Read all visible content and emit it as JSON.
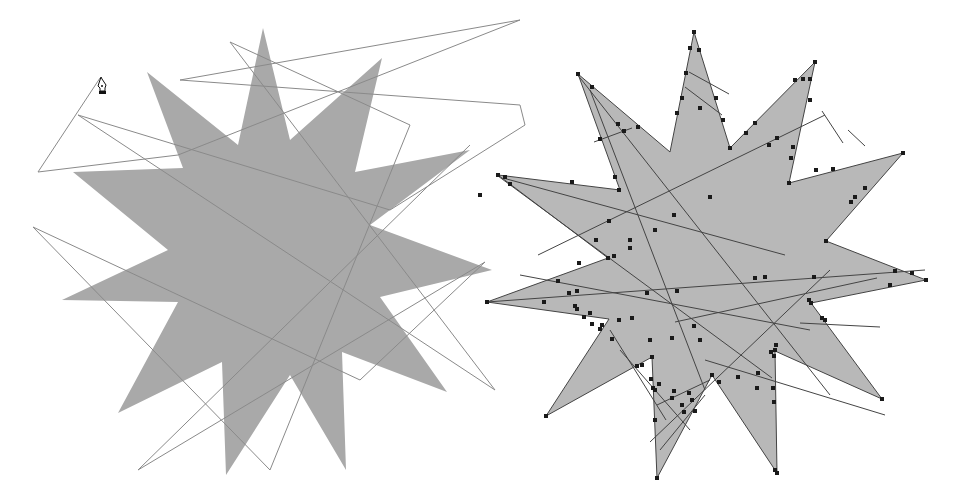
{
  "figure": {
    "colors": {
      "background": "#ffffff",
      "star_fill": "#a9a9a9",
      "right_star_fill": "#b8b8b8",
      "stroke": "#555555",
      "path_stroke": "#8a8a8a",
      "anchor": "#1a1a1a"
    }
  },
  "left_panel": {
    "star_points": "263,28 290,140 382,58 355,172 470,150 370,225 492,270 380,297 447,392 342,352 346,470 290,375 226,475 222,362 118,413 178,302 62,300 168,250 73,172 183,168 147,72 238,145",
    "path_points": "100,78 38,172 178,155 520,20 180,80 520,105 525,125 390,210 78,115 495,390 230,42 410,125 270,470 33,227 360,380 485,262 138,470 470,145",
    "cursor": "pen-tool-cursor"
  },
  "right_panel": {
    "star_points": "694,32 730,148 815,62 789,183 903,153 826,241 926,280 811,303 882,399 775,351 777,473 712,375 657,478 652,357 546,416 609,319 487,302 608,258 498,175 620,190 578,74 670,152",
    "lines": [
      "577,74 830,395",
      "590,90 705,390",
      "503,178 785,255",
      "498,176 772,378",
      "594,142 632,128",
      "689,72 729,94",
      "685,87 722,115",
      "822,111 843,143",
      "848,130 865,146",
      "520,275 810,330",
      "487,302 925,270",
      "538,255 825,115",
      "650,442 830,270",
      "675,322 877,278",
      "610,330 666,420",
      "620,350 690,430",
      "660,450 705,395",
      "657,405 710,380",
      "705,360 885,415",
      "800,323 880,327"
    ],
    "anchors": [
      [
        694,
        32
      ],
      [
        690,
        48
      ],
      [
        699,
        50
      ],
      [
        686,
        73
      ],
      [
        716,
        98
      ],
      [
        682,
        98
      ],
      [
        700,
        108
      ],
      [
        677,
        113
      ],
      [
        723,
        120
      ],
      [
        730,
        148
      ],
      [
        578,
        74
      ],
      [
        592,
        87
      ],
      [
        618,
        124
      ],
      [
        624,
        131
      ],
      [
        638,
        127
      ],
      [
        600,
        139
      ],
      [
        615,
        177
      ],
      [
        619,
        190
      ],
      [
        815,
        62
      ],
      [
        803,
        79
      ],
      [
        810,
        79
      ],
      [
        795,
        80
      ],
      [
        810,
        100
      ],
      [
        755,
        123
      ],
      [
        746,
        133
      ],
      [
        777,
        138
      ],
      [
        769,
        145
      ],
      [
        793,
        147
      ],
      [
        791,
        158
      ],
      [
        789,
        183
      ],
      [
        903,
        153
      ],
      [
        816,
        170
      ],
      [
        833,
        169
      ],
      [
        865,
        188
      ],
      [
        855,
        197
      ],
      [
        851,
        202
      ],
      [
        814,
        277
      ],
      [
        498,
        175
      ],
      [
        505,
        177
      ],
      [
        510,
        184
      ],
      [
        572,
        182
      ],
      [
        674,
        215
      ],
      [
        655,
        230
      ],
      [
        630,
        240
      ],
      [
        710,
        197
      ],
      [
        926,
        280
      ],
      [
        895,
        271
      ],
      [
        912,
        273
      ],
      [
        890,
        285
      ],
      [
        809,
        300
      ],
      [
        755,
        278
      ],
      [
        765,
        277
      ],
      [
        826,
        241
      ],
      [
        822,
        318
      ],
      [
        825,
        320
      ],
      [
        771,
        352
      ],
      [
        775,
        350
      ],
      [
        487,
        302
      ],
      [
        544,
        302
      ],
      [
        558,
        281
      ],
      [
        569,
        293
      ],
      [
        577,
        291
      ],
      [
        575,
        306
      ],
      [
        577,
        309
      ],
      [
        584,
        317
      ],
      [
        590,
        313
      ],
      [
        619,
        320
      ],
      [
        632,
        318
      ],
      [
        592,
        324
      ],
      [
        602,
        325
      ],
      [
        677,
        291
      ],
      [
        647,
        293
      ],
      [
        614,
        256
      ],
      [
        608,
        258
      ],
      [
        579,
        263
      ],
      [
        596,
        240
      ],
      [
        609,
        221
      ],
      [
        630,
        248
      ],
      [
        480,
        195
      ],
      [
        600,
        329
      ],
      [
        612,
        339
      ],
      [
        637,
        366
      ],
      [
        642,
        365
      ],
      [
        546,
        416
      ],
      [
        652,
        357
      ],
      [
        651,
        379
      ],
      [
        653,
        388
      ],
      [
        655,
        390
      ],
      [
        659,
        384
      ],
      [
        674,
        391
      ],
      [
        672,
        398
      ],
      [
        682,
        405
      ],
      [
        684,
        412
      ],
      [
        689,
        393
      ],
      [
        692,
        400
      ],
      [
        695,
        411
      ],
      [
        655,
        420
      ],
      [
        657,
        478
      ],
      [
        712,
        375
      ],
      [
        719,
        382
      ],
      [
        738,
        377
      ],
      [
        758,
        373
      ],
      [
        757,
        388
      ],
      [
        773,
        388
      ],
      [
        774,
        402
      ],
      [
        775,
        470
      ],
      [
        777,
        473
      ],
      [
        672,
        338
      ],
      [
        694,
        326
      ],
      [
        650,
        340
      ],
      [
        700,
        340
      ],
      [
        811,
        303
      ],
      [
        882,
        399
      ],
      [
        774,
        356
      ],
      [
        776,
        345
      ]
    ]
  }
}
